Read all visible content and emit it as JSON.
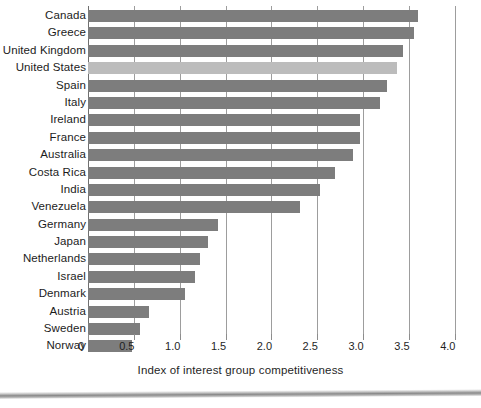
{
  "chart_data": {
    "type": "bar",
    "orientation": "horizontal",
    "title": "",
    "xlabel": "Index of interest group competitiveness",
    "ylabel": "",
    "xlim": [
      0,
      4.0
    ],
    "xticks": [
      "0",
      "0.5",
      "1.0",
      "1.5",
      "2.0",
      "2.5",
      "3.0",
      "3.5",
      "4.0"
    ],
    "xtick_values": [
      0,
      0.5,
      1.0,
      1.5,
      2.0,
      2.5,
      3.0,
      3.5,
      4.0
    ],
    "grid": "vertical",
    "legend": "none",
    "categories": [
      "Canada",
      "Greece",
      "United Kingdom",
      "United States",
      "Spain",
      "Italy",
      "Ireland",
      "France",
      "Australia",
      "Costa Rica",
      "India",
      "Venezuela",
      "Germany",
      "Japan",
      "Netherlands",
      "Israel",
      "Denmark",
      "Austria",
      "Sweden",
      "Norway"
    ],
    "values": [
      3.6,
      3.55,
      3.44,
      3.37,
      3.26,
      3.18,
      2.97,
      2.97,
      2.89,
      2.69,
      2.53,
      2.31,
      1.42,
      1.31,
      1.22,
      1.17,
      1.06,
      0.67,
      0.57,
      0.48
    ],
    "highlight_category": "United States",
    "colors": {
      "bar": "#7d7d7d",
      "bar_highlight": "#bcbcbc",
      "gridline": "#9d9d9d",
      "axis": "#6f6f6f",
      "text": "#1c1c1c",
      "background": "#ffffff"
    }
  }
}
